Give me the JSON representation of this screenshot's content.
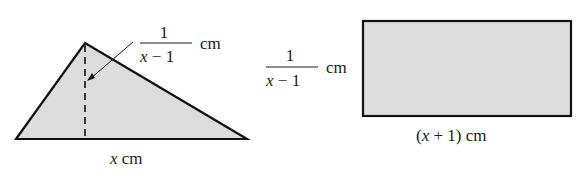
{
  "colors": {
    "fill": "#dcdcdc",
    "stroke": "#111111",
    "text": "#1a1a1a"
  },
  "triangle": {
    "height_label": {
      "numerator": "1",
      "denominator_var": "x",
      "denominator_rest": " − 1",
      "unit": "cm"
    },
    "base_label": {
      "var": "x",
      "unit": " cm"
    }
  },
  "rectangle": {
    "height_label": {
      "numerator": "1",
      "denominator_var": "x",
      "denominator_rest": " − 1",
      "unit": "cm"
    },
    "width_label": {
      "open": "(",
      "var": "x",
      "rest": " + 1) cm"
    }
  }
}
